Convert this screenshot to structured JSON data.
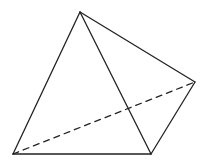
{
  "diagram": {
    "title": "",
    "shape": "tetrahedron",
    "stroke_color": "#222222",
    "background": "#ffffff",
    "vertices": {
      "top": [
        80,
        12
      ],
      "left": [
        13,
        154
      ],
      "bottom": [
        151,
        154
      ],
      "right": [
        195,
        82
      ]
    },
    "edges": [
      {
        "from": "top",
        "to": "left",
        "style": "solid"
      },
      {
        "from": "top",
        "to": "bottom",
        "style": "solid"
      },
      {
        "from": "top",
        "to": "right",
        "style": "solid"
      },
      {
        "from": "left",
        "to": "bottom",
        "style": "solid"
      },
      {
        "from": "bottom",
        "to": "right",
        "style": "solid"
      },
      {
        "from": "left",
        "to": "right",
        "style": "dashed"
      }
    ]
  }
}
